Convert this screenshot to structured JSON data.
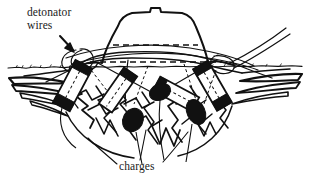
{
  "figure": {
    "type": "technical-line-illustration",
    "background_color": "#ffffff",
    "ink_color": "#111111",
    "width": 311,
    "height": 182
  },
  "labels": {
    "detonator_wires_line1": "detonator",
    "detonator_wires_line2": "wires",
    "charges": "charges"
  },
  "annotations": {
    "arrow_target": "wire loop at left of stump base",
    "leader_count": 3
  },
  "elements": {
    "stump_name": "tree-stump",
    "ground_name": "ground-surface-line",
    "charge_count": 4,
    "charge_labels": [
      "charge-1",
      "charge-2",
      "charge-3",
      "charge-4"
    ],
    "dashed_line_count": 2
  }
}
